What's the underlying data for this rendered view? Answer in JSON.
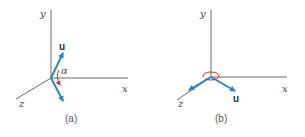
{
  "figure": {
    "colors": {
      "axis": "#6a6a6a",
      "vector": "#2f86b8",
      "arc": "#c0392b",
      "background": "#ffffff"
    },
    "panels": [
      {
        "id": "a",
        "caption": "(a)",
        "axis_labels": {
          "x": "x",
          "y": "y",
          "z": "z"
        },
        "vector_label": "u",
        "angle_label": "α"
      },
      {
        "id": "b",
        "caption": "(b)",
        "axis_labels": {
          "x": "x",
          "y": "y",
          "z": "z"
        },
        "vector_label": "u"
      }
    ]
  }
}
